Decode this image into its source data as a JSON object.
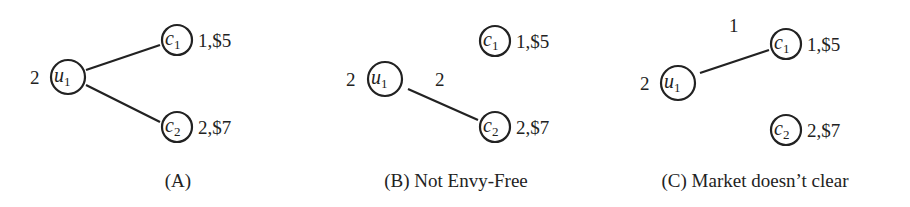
{
  "panels": [
    {
      "caption": "(A)",
      "user": {
        "name": "u",
        "sub": "1",
        "demand": "2"
      },
      "items": [
        {
          "name": "c",
          "sub": "1",
          "label": "1,$5"
        },
        {
          "name": "c",
          "sub": "2",
          "label": "2,$7"
        }
      ],
      "edges": [
        {
          "to": "c1",
          "label": ""
        },
        {
          "to": "c2",
          "label": ""
        }
      ]
    },
    {
      "caption": "(B) Not Envy-Free",
      "user": {
        "name": "u",
        "sub": "1",
        "demand": "2"
      },
      "items": [
        {
          "name": "c",
          "sub": "1",
          "label": "1,$5"
        },
        {
          "name": "c",
          "sub": "2",
          "label": "2,$7"
        }
      ],
      "edges": [
        {
          "to": "c2",
          "label": "2"
        }
      ]
    },
    {
      "caption": "(C) Market doesn’t clear",
      "user": {
        "name": "u",
        "sub": "1",
        "demand": "2"
      },
      "items": [
        {
          "name": "c",
          "sub": "1",
          "label": "1,$5"
        },
        {
          "name": "c",
          "sub": "2",
          "label": "2,$7"
        }
      ],
      "edges": [
        {
          "to": "c1",
          "label": "1"
        }
      ]
    }
  ]
}
